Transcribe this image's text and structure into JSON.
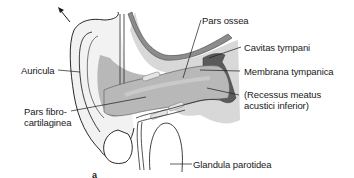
{
  "figure": {
    "panel_label": "a",
    "colors": {
      "background": "#ffffff",
      "outline": "#2a2a2a",
      "canal_fill": "#b8b8b8",
      "canal_light": "#d4d4d4",
      "bone_fill": "#d8d8d8",
      "bone_dark": "#8c8c8c",
      "tympanic_cavity": "#5a5a5a",
      "skin": "#f2f2f2"
    },
    "labels": {
      "auricula": "Auricula",
      "pars_ossea": "Pars ossea",
      "cavitas_tympani": "Cavitas tympani",
      "membrana_tympanica": "Membrana tympanica",
      "recessus_line1": "(Recessus meatus",
      "recessus_line2": "acustici inferior)",
      "pars_fibro_line1": "Pars fibro-",
      "pars_fibro_line2": "cartilaginea",
      "glandula_parotidea": "Glandula parotidea"
    },
    "arrow": "direction-arrow-up-left"
  }
}
